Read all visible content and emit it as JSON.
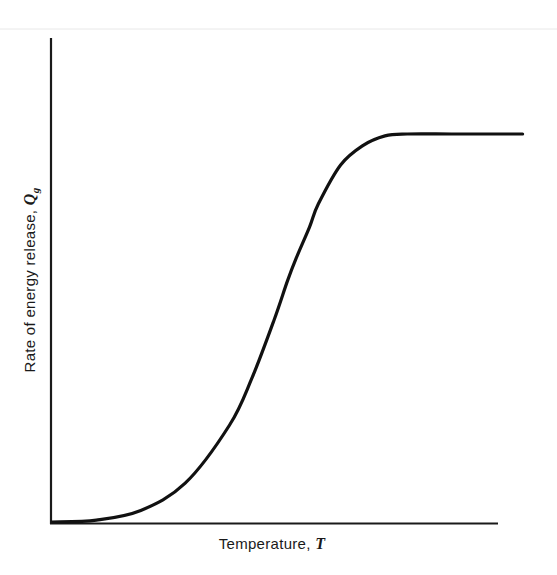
{
  "chart_data": {
    "type": "line",
    "title": "",
    "xlabel": "Temperature, T",
    "ylabel": "Rate of energy release, Q_g",
    "xlabel_parts": {
      "text": "Temperature, ",
      "variable": "T"
    },
    "ylabel_parts": {
      "text": "Rate of energy release, ",
      "variable": "Q",
      "subscript": "g"
    },
    "x_ticks": [],
    "y_ticks": [],
    "grid": false,
    "legend": null,
    "xlim": [
      0,
      1
    ],
    "ylim": [
      0,
      1
    ],
    "series": [
      {
        "name": "Q_g (sigmoid energy release curve)",
        "description": "S-shaped curve: near zero at low T, rises steeply at intermediate T, saturates to a constant plateau at high T",
        "x": [
          0.0,
          0.1,
          0.2,
          0.3,
          0.4,
          0.45,
          0.5,
          0.53,
          0.55,
          0.58,
          0.6,
          0.65,
          0.7,
          0.75,
          0.8,
          0.9,
          1.0,
          1.06
        ],
        "values": [
          0.0,
          0.005,
          0.03,
          0.1,
          0.25,
          0.37,
          0.52,
          0.62,
          0.68,
          0.76,
          0.82,
          0.92,
          0.97,
          0.995,
          1.0,
          1.0,
          1.0,
          1.0
        ]
      }
    ]
  },
  "axes": {
    "x_label_text": "Temperature, ",
    "x_label_var": "T",
    "y_label_text": "Rate of energy release, ",
    "y_label_var": "Q",
    "y_label_sub": "g"
  },
  "style": {
    "line_color": "#111111",
    "axis_color": "#1a1a1a",
    "background": "#ffffff"
  }
}
